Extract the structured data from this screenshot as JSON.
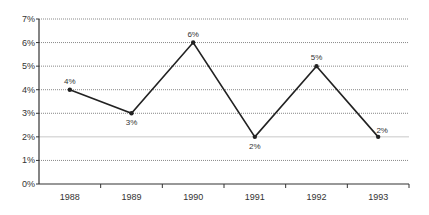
{
  "chart_data": {
    "type": "line",
    "title": "",
    "xlabel": "",
    "ylabel": "",
    "categories": [
      "1988",
      "1989",
      "1990",
      "1991",
      "1992",
      "1993"
    ],
    "series": [
      {
        "name": "Rate",
        "values": [
          4,
          3,
          6,
          2,
          5,
          2
        ]
      }
    ],
    "data_labels": [
      "4%",
      "3%",
      "6%",
      "2%",
      "5%",
      "2%"
    ],
    "yticks": [
      "0%",
      "1%",
      "2%",
      "3%",
      "4%",
      "5%",
      "6%",
      "7%"
    ],
    "ylim": [
      0,
      7
    ],
    "grid": true,
    "legend": "none",
    "colors": {
      "line": "#222222",
      "grid": "#999999",
      "axis": "#333333"
    }
  }
}
